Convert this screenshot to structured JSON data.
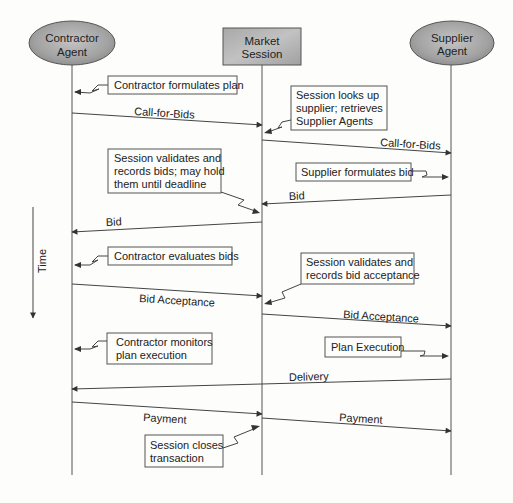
{
  "diagram": {
    "type": "sequence",
    "participants": [
      {
        "id": "contractor",
        "lines": [
          "Contractor",
          "Agent"
        ],
        "shape": "ellipse",
        "x": 72
      },
      {
        "id": "session",
        "lines": [
          "Market",
          "Session"
        ],
        "shape": "box",
        "x": 262
      },
      {
        "id": "supplier",
        "lines": [
          "Supplier",
          "Agent"
        ],
        "shape": "ellipse",
        "x": 451
      }
    ],
    "time_label": "Time",
    "messages": [
      {
        "label": "Call-for-Bids",
        "from": "contractor",
        "to": "session"
      },
      {
        "label": "Call-for-Bids",
        "from": "session",
        "to": "supplier"
      },
      {
        "label": "Bid",
        "from": "supplier",
        "to": "session"
      },
      {
        "label": "Bid",
        "from": "session",
        "to": "contractor"
      },
      {
        "label": "Bid Acceptance",
        "from": "contractor",
        "to": "session"
      },
      {
        "label": "Bid Acceptance",
        "from": "session",
        "to": "supplier"
      },
      {
        "label": "Delivery",
        "from": "supplier",
        "to": "contractor"
      },
      {
        "label": "Payment",
        "from": "contractor",
        "to": "session"
      },
      {
        "label": "Payment",
        "from": "session",
        "to": "supplier"
      }
    ],
    "notes": [
      {
        "lines": [
          "Contractor formulates plan"
        ]
      },
      {
        "lines": [
          "Session looks up",
          "supplier; retrieves",
          "Supplier Agents"
        ]
      },
      {
        "lines": [
          "Supplier formulates bid"
        ]
      },
      {
        "lines": [
          "Session validates and",
          "records bids; may hold",
          "them until deadline"
        ]
      },
      {
        "lines": [
          "Contractor evaluates bids"
        ]
      },
      {
        "lines": [
          "Session validates and",
          "records bid acceptance"
        ]
      },
      {
        "lines": [
          "Contractor monitors",
          "plan execution"
        ]
      },
      {
        "lines": [
          "Plan Execution"
        ]
      },
      {
        "lines": [
          "Session closes",
          "transaction"
        ]
      }
    ],
    "colors": {
      "actor_fill": "#9a9a9a",
      "line": "#444444",
      "background": "#fdfdfb"
    }
  }
}
